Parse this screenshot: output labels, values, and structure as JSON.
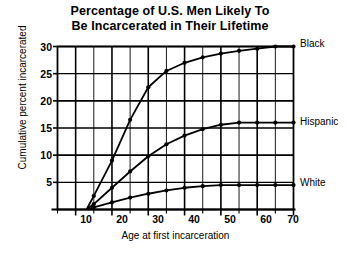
{
  "chart_data": {
    "type": "line",
    "title": "Percentage of U.S. Men Likely To Be Incarcerated in Their Lifetime",
    "title_lines": [
      "Percentage of U.S. Men Likely To",
      "Be Incarcerated in Their Lifetime"
    ],
    "xlabel": "Age at first incarceration",
    "ylabel": "Cumulative percent incarcerated",
    "xlim": [
      5,
      70
    ],
    "ylim": [
      0,
      30
    ],
    "xticks": [
      10,
      20,
      30,
      40,
      50,
      60,
      70
    ],
    "xtick_labels": [
      "10",
      "20",
      "30",
      "40",
      "50",
      "60",
      "70"
    ],
    "yticks": [
      5,
      10,
      15,
      20,
      25,
      30
    ],
    "ytick_labels": [
      "5",
      "10",
      "15",
      "20",
      "25",
      "30"
    ],
    "x_minor_step": 5,
    "grid": true,
    "grid_color": "#000000",
    "legend_position": "right-of-axes",
    "marker": "circle",
    "x": [
      13,
      15,
      20,
      25,
      30,
      35,
      40,
      45,
      50,
      55,
      60,
      65,
      70
    ],
    "series": [
      {
        "name": "Black",
        "label": "Black",
        "color": "#000000",
        "values": [
          0,
          2.5,
          9.0,
          16.5,
          22.5,
          25.5,
          27.0,
          28.0,
          28.7,
          29.2,
          29.6,
          30.0,
          30.0
        ]
      },
      {
        "name": "Hispanic",
        "label": "Hispanic",
        "color": "#000000",
        "values": [
          0,
          1.0,
          4.0,
          7.0,
          9.8,
          12.0,
          13.6,
          14.8,
          15.6,
          16.0,
          16.0,
          16.0,
          16.0
        ]
      },
      {
        "name": "White",
        "label": "White",
        "color": "#000000",
        "values": [
          0,
          0.4,
          1.3,
          2.2,
          2.9,
          3.5,
          4.0,
          4.3,
          4.5,
          4.5,
          4.5,
          4.5,
          4.5
        ]
      }
    ]
  },
  "labels": {
    "series_black": "Black",
    "series_hispanic": "Hispanic",
    "series_white": "White"
  }
}
